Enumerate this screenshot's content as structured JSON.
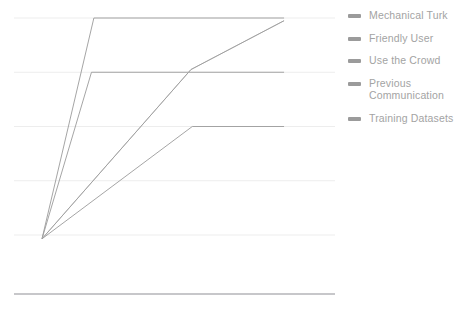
{
  "chart_data": {
    "type": "line",
    "title": "",
    "xlabel": "",
    "ylabel": "",
    "grid": true,
    "gridlines_y": [
      5,
      4,
      3,
      2,
      1
    ],
    "xlim": [
      0,
      10
    ],
    "ylim": [
      0,
      5
    ],
    "legend_position": "right",
    "x": [
      0,
      2,
      2.1,
      5.8,
      6.1,
      9.1
    ],
    "series": [
      {
        "name": "Mechanical Turk",
        "color": "#9b9b9b",
        "points": [
          [
            0,
            0.93
          ],
          [
            1.95,
            5.0
          ],
          [
            9.1,
            5.0
          ]
        ]
      },
      {
        "name": "Friendly User",
        "color": "#9b9b9b",
        "points": [
          [
            0,
            0.93
          ],
          [
            1.86,
            4.0
          ],
          [
            9.1,
            4.0
          ]
        ]
      },
      {
        "name": "Use the Crowd",
        "color": "#c9c9c9",
        "points": [
          [
            0,
            0.93
          ],
          [
            5.6,
            4.05
          ],
          [
            9.1,
            4.95
          ]
        ]
      },
      {
        "name": "Previous Communication",
        "color": "#9b9b9b",
        "points": [
          [
            0,
            0.93
          ],
          [
            5.6,
            4.05
          ],
          [
            9.1,
            4.95
          ]
        ]
      },
      {
        "name": "Training Datasets",
        "color": "#9b9b9b",
        "points": [
          [
            0,
            0.93
          ],
          [
            5.65,
            3.0
          ],
          [
            9.1,
            3.0
          ]
        ]
      }
    ]
  },
  "legend": {
    "items": [
      {
        "label": "Mechanical Turk"
      },
      {
        "label": "Friendly User"
      },
      {
        "label": "Use the Crowd"
      },
      {
        "label": "Previous\nCommunication"
      },
      {
        "label": "Training Datasets"
      }
    ]
  },
  "colors": {
    "line": "#9b9b9b",
    "line_light": "#c9c9c9",
    "gridline": "#ededed",
    "axis": "#8f8f95",
    "legend_text": "#a3a3a3",
    "legend_swatch": "#9b9b9b"
  }
}
